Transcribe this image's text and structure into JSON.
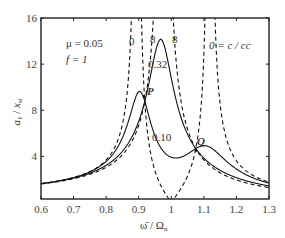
{
  "chart_data": {
    "type": "line",
    "title": "",
    "xlabel": "ω̄ / Ωn",
    "ylabel": "a1 / xst",
    "xlim": [
      0.6,
      1.3
    ],
    "ylim": [
      0.3,
      16
    ],
    "x_ticks": [
      0.6,
      0.7,
      0.8,
      0.9,
      1,
      1.1,
      1.2,
      1.3
    ],
    "x_tick_labels": [
      "0.6",
      "0.7",
      "0.8",
      "0.9",
      "1",
      "1.1",
      "1.2",
      "1.3"
    ],
    "y_ticks": [
      4,
      8,
      12,
      16
    ],
    "y_tick_labels": [
      "4",
      "8",
      "12",
      "16"
    ],
    "grid": false,
    "parameters": {
      "mu": 0.05,
      "f": 1
    },
    "annotations": {
      "mu_text": "μ = 0.05",
      "f_text": "f = 1",
      "damping_label": "0 = c / cc",
      "label_zero": "0",
      "label_inf_1": "8",
      "label_inf_2": "8",
      "label_032": "0.32",
      "label_010": "0.10",
      "point_P": "P",
      "point_Q": "Q"
    },
    "fixed_points": [
      {
        "name": "P",
        "x": 0.916,
        "y": 9.2
      },
      {
        "name": "Q",
        "x": 1.076,
        "y": 4.5
      }
    ],
    "series": [
      {
        "name": "c/cc = 0",
        "style": "dashed",
        "zeta": 0,
        "description": "undamped: poles near 0.895 and 1.118, zero at 1.0",
        "points": [
          [
            0.6,
            1.6
          ],
          [
            0.7,
            2.0
          ],
          [
            0.8,
            3.1
          ],
          [
            0.85,
            5.2
          ],
          [
            0.88,
            11
          ],
          [
            0.895,
            16
          ],
          [
            0.95,
            3.0
          ],
          [
            1.0,
            0
          ],
          [
            1.05,
            2.2
          ],
          [
            1.1,
            8.5
          ],
          [
            1.118,
            16
          ],
          [
            1.15,
            6
          ],
          [
            1.2,
            3.2
          ],
          [
            1.3,
            1.7
          ]
        ]
      },
      {
        "name": "c/cc = ∞",
        "style": "dashed",
        "zeta": "inf",
        "description": "single-DOF with combined mass, pole at 0.976",
        "points": [
          [
            0.6,
            1.6
          ],
          [
            0.7,
            2.0
          ],
          [
            0.8,
            2.8
          ],
          [
            0.9,
            5.3
          ],
          [
            0.95,
            11
          ],
          [
            0.976,
            16
          ],
          [
            1.0,
            14
          ],
          [
            1.05,
            5.5
          ],
          [
            1.1,
            3.5
          ],
          [
            1.2,
            2.0
          ],
          [
            1.3,
            1.4
          ]
        ]
      },
      {
        "name": "c/cc = 0.32",
        "style": "solid",
        "zeta": 0.32,
        "points": [
          [
            0.6,
            1.6
          ],
          [
            0.7,
            2.0
          ],
          [
            0.8,
            3.0
          ],
          [
            0.9,
            7.0
          ],
          [
            0.916,
            9.2
          ],
          [
            0.965,
            14.2
          ],
          [
            1.0,
            11
          ],
          [
            1.05,
            6.5
          ],
          [
            1.076,
            4.5
          ],
          [
            1.1,
            3.6
          ],
          [
            1.2,
            2.0
          ],
          [
            1.3,
            1.4
          ]
        ]
      },
      {
        "name": "c/cc = 0.10",
        "style": "solid",
        "zeta": 0.1,
        "points": [
          [
            0.6,
            1.6
          ],
          [
            0.7,
            2.0
          ],
          [
            0.8,
            3.2
          ],
          [
            0.87,
            6.5
          ],
          [
            0.9,
            9.6
          ],
          [
            0.916,
            9.2
          ],
          [
            0.95,
            5.0
          ],
          [
            0.995,
            3.5
          ],
          [
            1.05,
            4.0
          ],
          [
            1.076,
            4.5
          ],
          [
            1.12,
            4.9
          ],
          [
            1.2,
            2.9
          ],
          [
            1.3,
            1.7
          ]
        ]
      }
    ]
  }
}
